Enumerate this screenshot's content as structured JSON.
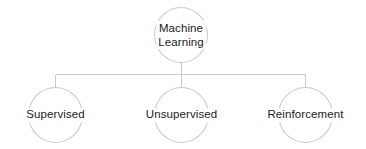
{
  "diagram": {
    "type": "hierarchy-tree",
    "background_color": "#ffffff",
    "stroke_color": "#c9c9c9",
    "text_color": "#1c1c1c",
    "root": {
      "id": "machine-learning",
      "label": "Machine\nLearning",
      "label_line_1": "Machine",
      "label_line_2": "Learning"
    },
    "children": [
      {
        "id": "supervised",
        "label": "Supervised"
      },
      {
        "id": "unsupervised",
        "label": "Unsupervised"
      },
      {
        "id": "reinforcement",
        "label": "Reinforcement"
      }
    ]
  }
}
